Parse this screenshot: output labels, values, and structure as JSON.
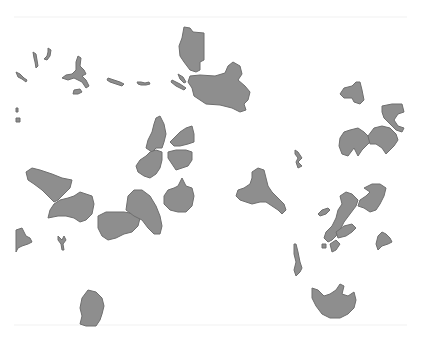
{
  "map": {
    "width": 421,
    "height": 339,
    "background": "#ffffff",
    "fill_color": "#8e8e8e",
    "stroke_color": "#6e6e6e",
    "scan_lines_y": [
      17,
      325
    ],
    "features": [
      {
        "id": "top-center-north",
        "points": "184,27 190,28 193,32 204,33 204,60 200,62 200,70 196,72 190,70 184,62 180,56 179,46 182,38"
      },
      {
        "id": "top-center-main",
        "points": "190,76 200,75 215,76 225,73 228,66 233,62 240,66 242,74 238,80 245,86 250,92 248,100 244,104 246,110 240,112 232,108 220,105 206,104 200,100 194,96 192,88 188,82"
      },
      {
        "id": "top-center-spit-1",
        "points": "178,74 183,77 186,82 184,83 180,79"
      },
      {
        "id": "top-center-spit-2",
        "points": "172,80 180,84 186,88 184,90 176,86 171,82"
      },
      {
        "id": "nw-channel-1",
        "points": "16,72 20,74 24,78 27,80 26,82 22,79 18,77"
      },
      {
        "id": "nw-channel-2",
        "points": "33,52 36,54 37,60 38,66 36,68 35,62 34,58"
      },
      {
        "id": "nw-channel-3",
        "points": "48,48 51,50 50,56 47,60 44,59 47,56 48,52"
      },
      {
        "id": "nw-lake-branch",
        "points": "78,56 81,58 80,66 84,70 86,74 82,76 86,80 89,86 86,88 82,82 78,80 74,78 68,80 62,78 66,75 72,74 76,70 76,62"
      },
      {
        "id": "nw-small-lake",
        "points": "74,90 80,89 82,92 78,94 73,94"
      },
      {
        "id": "nw-dash-1",
        "points": "108,78 114,80 120,82 124,84 122,86 116,84 110,82 107,80"
      },
      {
        "id": "nw-dash-2",
        "points": "137,82 141,82 145,83 149,82 150,84 146,85 141,85 138,84"
      },
      {
        "id": "nw-edge-1",
        "points": "16,108 18,108 18,112 16,112"
      },
      {
        "id": "nw-edge-2",
        "points": "16,118 20,118 20,122 16,122"
      },
      {
        "id": "east-small",
        "points": "344,88 352,86 356,82 360,82 362,90 364,100 360,104 354,102 352,98 344,98 340,94"
      },
      {
        "id": "east-hook",
        "points": "382,106 392,104 402,104 404,112 398,114 394,120 398,126 404,128 402,132 396,130 390,124 384,118 382,112"
      },
      {
        "id": "east-cluster-left",
        "points": "344,132 350,130 358,128 364,132 368,136 370,142 366,146 362,150 358,156 354,148 348,156 342,154 339,146 340,138"
      },
      {
        "id": "east-cluster-right",
        "points": "368,136 374,128 382,126 390,128 396,134 398,140 394,146 390,150 386,154 382,148 376,144 370,144"
      },
      {
        "id": "mid-sliver-north",
        "points": "156,118 160,116 164,124 166,134 164,142 162,148 156,148 152,152 146,148 148,140 152,132 154,124"
      },
      {
        "id": "mid-sliver-main",
        "points": "150,152 156,150 162,152 162,160 160,168 156,174 150,178 144,176 138,172 136,166 140,160 146,156"
      },
      {
        "id": "mid-right-upper",
        "points": "180,132 186,128 192,126 194,134 194,142 188,144 180,146 174,146 170,142 174,138"
      },
      {
        "id": "mid-right-lower",
        "points": "168,152 176,150 186,150 192,152 192,160 188,166 182,168 176,170 172,164 168,158"
      },
      {
        "id": "mid-right-round",
        "points": "180,182 182,178 184,182 186,186 192,188 194,196 192,206 186,212 178,212 170,210 164,204 164,196 168,190 174,188 178,186"
      },
      {
        "id": "west-north",
        "points": "26,172 32,168 40,170 52,174 62,178 72,180 70,188 64,194 58,200 54,202 48,196 42,190 34,184 28,180"
      },
      {
        "id": "west-middle",
        "points": "50,210 54,204 60,200 68,198 74,196 80,192 86,194 92,196 94,204 92,214 86,220 80,222 74,218 66,216 58,216 48,218"
      },
      {
        "id": "center-blob",
        "points": "98,216 106,212 114,212 124,212 136,214 140,218 138,226 132,232 124,234 116,238 108,240 102,236 98,228"
      },
      {
        "id": "center-tall",
        "points": "128,196 134,190 142,190 150,196 156,206 160,216 162,226 160,234 154,234 148,228 142,220 134,216 126,210"
      },
      {
        "id": "sw-edge",
        "points": "16,230 22,228 26,236 30,238 32,242 28,244 22,246 18,248 16,252"
      },
      {
        "id": "sw-fork",
        "points": "58,236 62,240 64,236 66,240 63,244 64,250 62,250 61,244 58,240"
      },
      {
        "id": "central-lake",
        "points": "252,172 258,168 264,170 266,178 268,186 272,192 278,198 284,204 286,210 282,214 278,210 272,206 266,202 260,202 252,204 246,202 240,200 236,196 238,190 244,188 250,184 252,178"
      },
      {
        "id": "central-wisp",
        "points": "295,150 298,152 302,158 298,162 302,166 298,168 296,162 298,158 295,154"
      },
      {
        "id": "right-chain-upper",
        "points": "364,188 372,184 380,184 386,188 384,196 380,204 376,210 370,212 364,208 358,206 360,200 366,196 370,192"
      },
      {
        "id": "right-chain-spine",
        "points": "340,196 346,192 352,194 358,200 356,206 350,214 344,222 340,230 336,236 332,240 328,242 324,238 326,232 332,226 336,218 338,210 342,204"
      },
      {
        "id": "right-chain-arm",
        "points": "336,232 344,226 352,224 356,228 352,232 346,236 338,238"
      },
      {
        "id": "right-chain-tip",
        "points": "318,214 322,210 328,208 330,210 326,214 320,216"
      },
      {
        "id": "right-chain-lower",
        "points": "330,244 336,240 340,244 336,250 332,252"
      },
      {
        "id": "right-chain-small",
        "points": "322,244 326,244 326,248 322,248"
      },
      {
        "id": "far-right-lake",
        "points": "378,236 382,232 386,234 390,238 392,242 388,244 382,246 378,250 376,244"
      },
      {
        "id": "south-sliver",
        "points": "294,244 296,244 298,252 300,262 302,268 300,272 296,276 294,270 296,262 294,254"
      },
      {
        "id": "south-east-lake",
        "points": "312,288 318,290 324,296 330,294 336,290 340,284 344,286 342,294 348,296 354,292 356,300 354,308 348,314 340,318 330,318 322,314 316,306 312,298"
      },
      {
        "id": "south-west-lake",
        "points": "82,298 88,290 96,292 102,298 104,306 102,314 100,320 96,326 86,326 80,324 82,316 80,308"
      }
    ]
  }
}
